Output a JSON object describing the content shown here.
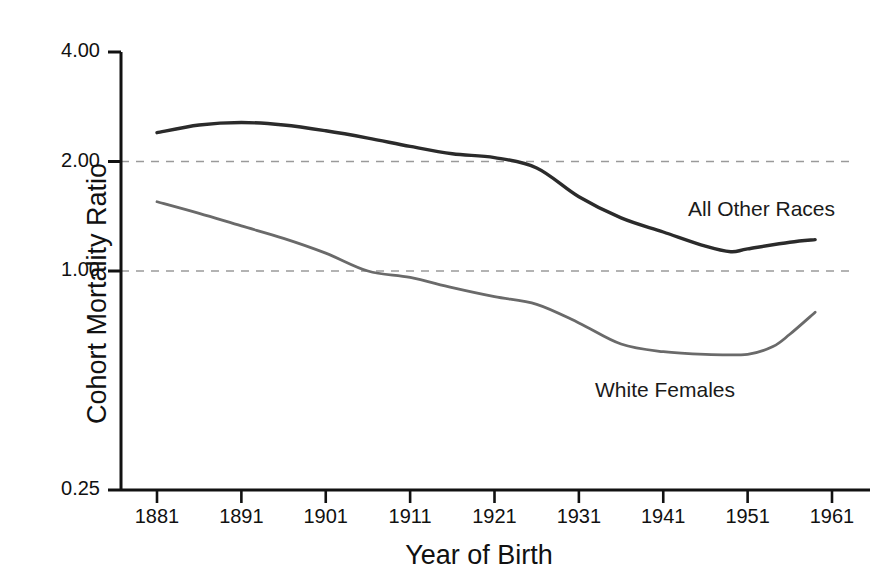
{
  "chart_data": {
    "type": "line",
    "title": "",
    "xlabel": "Year of Birth",
    "ylabel": "Cohort Mortality Ratio",
    "yscale": "log",
    "ylim": [
      0.25,
      4.0
    ],
    "xlim": [
      1881,
      1961
    ],
    "grid": true,
    "gridlines_y": [
      2.0,
      1.0
    ],
    "legend_position": "inline-annotation",
    "ytick_labels": [
      "4.00",
      "2.00",
      "1.00",
      "0.25"
    ],
    "ytick_values": [
      4.0,
      2.0,
      1.0,
      0.25
    ],
    "xtick_labels": [
      "1881",
      "1891",
      "1901",
      "1911",
      "1921",
      "1931",
      "1941",
      "1951",
      "1961"
    ],
    "xtick_values": [
      1881,
      1891,
      1901,
      1911,
      1921,
      1931,
      1941,
      1951,
      1961
    ],
    "series": [
      {
        "name": "All Other Races",
        "color": "#2b2b2b",
        "x": [
          1881,
          1886,
          1891,
          1896,
          1901,
          1906,
          1911,
          1916,
          1921,
          1926,
          1931,
          1936,
          1941,
          1946,
          1949,
          1951,
          1956,
          1959
        ],
        "values": [
          2.4,
          2.52,
          2.56,
          2.52,
          2.43,
          2.32,
          2.2,
          2.1,
          2.05,
          1.92,
          1.6,
          1.4,
          1.28,
          1.17,
          1.13,
          1.15,
          1.2,
          1.22
        ]
      },
      {
        "name": "White Females",
        "color": "#6a6a6a",
        "x": [
          1881,
          1886,
          1891,
          1896,
          1901,
          1906,
          1911,
          1916,
          1921,
          1926,
          1931,
          1936,
          1941,
          1946,
          1951,
          1954,
          1956,
          1959
        ],
        "values": [
          1.55,
          1.44,
          1.33,
          1.23,
          1.12,
          1.0,
          0.96,
          0.9,
          0.85,
          0.81,
          0.72,
          0.63,
          0.6,
          0.59,
          0.59,
          0.62,
          0.67,
          0.77
        ]
      }
    ]
  },
  "annotations": {
    "all_other_races": "All Other Races",
    "white_females": "White Females"
  },
  "axes": {
    "y_title": "Cohort Mortality Ratio",
    "x_title": "Year of Birth"
  },
  "colors": {
    "series_dark": "#2b2b2b",
    "series_gray": "#6a6a6a",
    "axis": "#111111",
    "gridline": "#9a9a9a",
    "background": "#ffffff"
  }
}
